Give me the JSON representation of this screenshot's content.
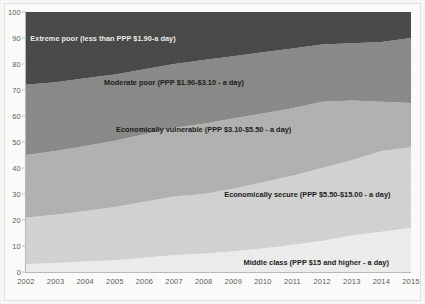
{
  "chart_data": {
    "type": "area",
    "title": "",
    "subtitle": "",
    "xlabel": "",
    "ylabel": "",
    "stacked": true,
    "stack_order": "bottom-to-top",
    "grid": false,
    "legend": "in-plot labels",
    "xlim": [
      2002,
      2015
    ],
    "ylim": [
      0,
      100
    ],
    "x": [
      2002,
      2003,
      2004,
      2005,
      2006,
      2007,
      2008,
      2009,
      2010,
      2011,
      2012,
      2013,
      2014,
      2015
    ],
    "xtick_labels": [
      "2002",
      "2003",
      "2004",
      "2005",
      "2006",
      "2007",
      "2008",
      "2009",
      "2010",
      "2011",
      "2012",
      "2013",
      "2014",
      "2015"
    ],
    "ytick_labels": [
      "0",
      "10",
      "20",
      "30",
      "40",
      "50",
      "60",
      "70",
      "80",
      "90",
      "100"
    ],
    "ytick_values": [
      0,
      10,
      20,
      30,
      40,
      50,
      60,
      70,
      80,
      90,
      100
    ],
    "series": [
      {
        "name": "Middle class (PPP $15 and higher - a day)",
        "label": "Middle class (PPP $15 and higher - a day)",
        "color": "#ececea",
        "label_color": "dark",
        "values": [
          3,
          3.5,
          4,
          4.5,
          5.5,
          6.5,
          7,
          8,
          9,
          10.5,
          12,
          14,
          15.5,
          17
        ],
        "cumulative_top": [
          3,
          3.5,
          4,
          4.5,
          5.5,
          6.5,
          7,
          8,
          9,
          10.5,
          12,
          14,
          15.5,
          17
        ]
      },
      {
        "name": "Economically secure (PPP $5.50-$15.00 - a day)",
        "label": "Economically secure (PPP $5.50-$15.00 - a day)",
        "color": "#d2d2d0",
        "label_color": "dark",
        "values": [
          18,
          18.5,
          19.5,
          20.5,
          21.5,
          22.5,
          23,
          24,
          25.5,
          26.5,
          28,
          29,
          31,
          31
        ],
        "cumulative_top": [
          21,
          22,
          23.5,
          25,
          27,
          29,
          30,
          32,
          34.5,
          37,
          40,
          43,
          46.5,
          48
        ]
      },
      {
        "name": "Economically vulnerable (PPP $3.10-$5.50 - a day)",
        "label": "Economically vulnerable (PPP $3.10-$5.50 - a day)",
        "color": "#b1b1af",
        "label_color": "dark",
        "values": [
          24,
          24.5,
          25,
          25.5,
          26,
          26.5,
          27,
          27,
          26.5,
          26,
          25.5,
          23,
          19,
          17
        ],
        "cumulative_top": [
          45,
          46.5,
          48.5,
          50.5,
          53,
          55.5,
          57,
          59,
          61,
          63,
          65.5,
          66,
          65.5,
          65
        ]
      },
      {
        "name": "Moderate poor (PPP $1.90-$3.10 - a day)",
        "label": "Moderate poor (PPP $1.90-$3.10 - a day)",
        "color": "#8a8a88",
        "label_color": "dark",
        "values": [
          27,
          26.5,
          26,
          25.5,
          25,
          24.5,
          24.5,
          24,
          23.5,
          23,
          22,
          22,
          23,
          25
        ],
        "cumulative_top": [
          72,
          73,
          74.5,
          76,
          78,
          80,
          81.5,
          83,
          84.5,
          86,
          87.5,
          88,
          88.5,
          90
        ]
      },
      {
        "name": "Extreme poor (less than PPP $1.90-a day)",
        "label": "Extreme poor (less than PPP $1.90-a day)",
        "color": "#4a4a48",
        "label_color": "light",
        "values": [
          28,
          27,
          25.5,
          24,
          22,
          20,
          18.5,
          17,
          15.5,
          14,
          12.5,
          12,
          11.5,
          10
        ],
        "cumulative_top": [
          100,
          100,
          100,
          100,
          100,
          100,
          100,
          100,
          100,
          100,
          100,
          100,
          100,
          100
        ]
      }
    ],
    "annotations": [
      {
        "text": "Extreme poor (less than PPP $1.90-a day)",
        "x": 2004.6,
        "y": 90,
        "style": "light"
      },
      {
        "text": "Moderate poor (PPP $1.90-$3.10 - a day)",
        "x": 2007.0,
        "y": 73,
        "style": "dark"
      },
      {
        "text": "Economically vulnerable (PPP $3.10-$5.50 - a day)",
        "x": 2008.0,
        "y": 55,
        "style": "dark"
      },
      {
        "text": "Economically secure (PPP $5.50-$15.00 - a day)",
        "x": 2011.5,
        "y": 30,
        "style": "dark"
      },
      {
        "text": "Middle class (PPP $15 and higher - a day)",
        "x": 2011.8,
        "y": 4,
        "style": "dark"
      }
    ]
  }
}
